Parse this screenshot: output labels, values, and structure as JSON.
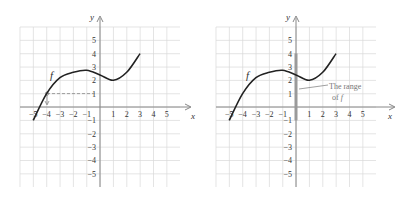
{
  "chart_data": [
    {
      "type": "line",
      "title": "",
      "panel": "left",
      "xlabel": "x",
      "ylabel": "y",
      "xlim": [
        -6,
        6
      ],
      "ylim": [
        -6,
        6
      ],
      "grid": true,
      "x_ticks": [
        -5,
        -4,
        -3,
        -2,
        -1,
        1,
        2,
        3,
        4,
        5
      ],
      "y_ticks": [
        5,
        4,
        3,
        2,
        1,
        -1,
        -2,
        -3,
        -4,
        -5
      ],
      "series": [
        {
          "name": "f",
          "x": [
            -5,
            -4,
            -3,
            -2,
            -1,
            0,
            1,
            2,
            3
          ],
          "y": [
            -1,
            1,
            2.2,
            2.6,
            2.75,
            2.4,
            2,
            2.6,
            4
          ]
        }
      ],
      "annotations": [
        {
          "text": "f",
          "x": -3.5,
          "y": 2.3
        },
        {
          "text": "dashed line from point (-4, 1) to y-axis at y=1",
          "type": "dashed-guide"
        },
        {
          "text": "arrow from point (-4, 1) down to x-axis at x=-4",
          "type": "arrow"
        }
      ]
    },
    {
      "type": "line",
      "title": "",
      "panel": "right",
      "xlabel": "x",
      "ylabel": "y",
      "xlim": [
        -6,
        6
      ],
      "ylim": [
        -6,
        6
      ],
      "grid": true,
      "x_ticks": [
        -5,
        -4,
        -3,
        -2,
        -1,
        1,
        2,
        3,
        4,
        5
      ],
      "y_ticks": [
        5,
        4,
        3,
        2,
        1,
        -1,
        -2,
        -3,
        -4,
        -5
      ],
      "series": [
        {
          "name": "f",
          "x": [
            -5,
            -4,
            -3,
            -2,
            -1,
            0,
            1,
            2,
            3
          ],
          "y": [
            -1,
            1,
            2.2,
            2.6,
            2.75,
            2.4,
            2,
            2.6,
            4
          ]
        }
      ],
      "highlight": {
        "axis": "y",
        "from": -1,
        "to": 4,
        "label": "The range of f"
      },
      "annotations": [
        {
          "text": "f",
          "x": -3.5,
          "y": 2.3
        },
        {
          "text": "The range",
          "x": 2.4,
          "y": 1.7
        },
        {
          "text": "of f",
          "x": 2.4,
          "y": 0.8
        }
      ]
    }
  ],
  "labels": {
    "axis_x": "x",
    "axis_y": "y",
    "func": "f",
    "range_line1": "The range",
    "range_line2_prefix": "of ",
    "range_line2_func": "f",
    "ticks_x": [
      "−5",
      "−4",
      "−3",
      "−2",
      "−1",
      "1",
      "2",
      "3",
      "4",
      "5"
    ],
    "ticks_y": [
      "5",
      "4",
      "3",
      "2",
      "1",
      "−1",
      "−2",
      "−3",
      "−4",
      "−5"
    ]
  },
  "colors": {
    "grid": "#d9d9d9",
    "axis": "#888888",
    "curve": "#222222",
    "range_bar": "#9a9a9a",
    "text": "#333333"
  }
}
